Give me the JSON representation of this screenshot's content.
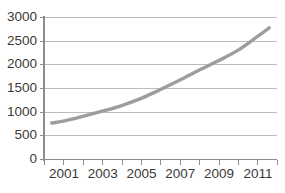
{
  "chart_data": {
    "type": "line",
    "title": "",
    "subtitle": "",
    "xlabel": "",
    "ylabel": "",
    "xlim": [
      2000,
      2012
    ],
    "ylim": [
      0,
      3000
    ],
    "grid": true,
    "legend": false,
    "legend_position": "none",
    "line_color": "#9d9d9d",
    "gridline_color": "#b6b6b6",
    "axis_color": "#8d8d8d",
    "text_color": "#3a3a3a",
    "background_color": "#ffffff",
    "y_ticks": [
      0,
      500,
      1000,
      1500,
      2000,
      2500,
      3000
    ],
    "y_tick_labels": [
      "0",
      "500",
      "1000",
      "1500",
      "2000",
      "2500",
      "3000"
    ],
    "x_ticks": [
      2000,
      2001,
      2002,
      2003,
      2004,
      2005,
      2006,
      2007,
      2008,
      2009,
      2010,
      2011,
      2012
    ],
    "x_tick_labels": [
      "",
      "2001",
      "",
      "2003",
      "",
      "2005",
      "",
      "2007",
      "",
      "2009",
      "",
      "2011",
      ""
    ],
    "x_labeled_years": [
      "2001",
      "2003",
      "2005",
      "2007",
      "2009",
      "2011"
    ],
    "series": [
      {
        "name": "series-1",
        "color": "#9d9d9d",
        "x": [
          2000.4,
          2001,
          2002,
          2003,
          2004,
          2005,
          2006,
          2007,
          2008,
          2009,
          2010,
          2011,
          2011.6
        ],
        "values": [
          770,
          810,
          910,
          1020,
          1140,
          1290,
          1480,
          1680,
          1890,
          2090,
          2310,
          2600,
          2780
        ]
      }
    ]
  }
}
